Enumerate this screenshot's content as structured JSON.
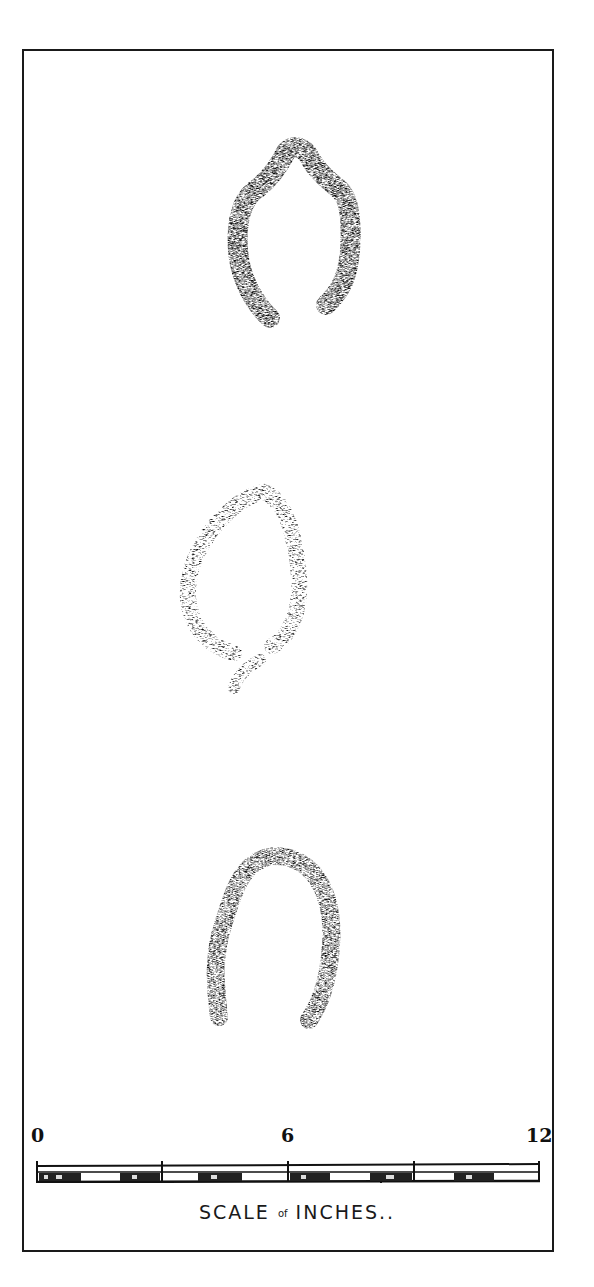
{
  "figure": {
    "prints": [
      {
        "name": "print-top",
        "shape": "open horseshoe with pointed top"
      },
      {
        "name": "print-middle",
        "shape": "oval leaf-like outline"
      },
      {
        "name": "print-bottom",
        "shape": "rounded open arch"
      }
    ],
    "scale": {
      "labels": [
        "0",
        "6",
        "12"
      ],
      "caption_main": "SCALE",
      "caption_of": "of",
      "caption_unit": "INCHES..",
      "range_inches": [
        0,
        12
      ],
      "divisions": 4
    }
  }
}
